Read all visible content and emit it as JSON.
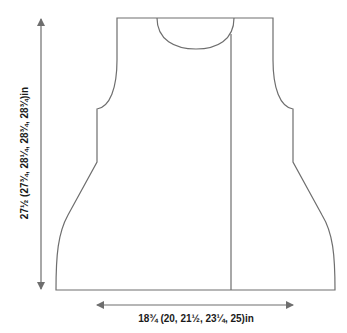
{
  "diagram": {
    "type": "knitting-schematic",
    "piece": "garment front/back panel",
    "line_color": "#6e6e6e",
    "label_color": "#1a1a1a",
    "dimensions": {
      "width_label": "18¾ (20, 21½, 23¼, 25)in",
      "length_label": "27½ (27¾, 28¼, 28¾, 28¾)in"
    }
  }
}
